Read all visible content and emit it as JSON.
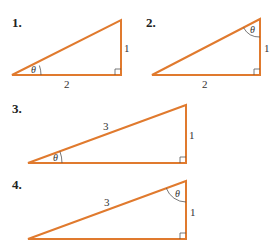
{
  "colors": {
    "triangle_stroke": "#e07a2e",
    "text": "#222222",
    "marks": "#555555"
  },
  "problems": [
    {
      "number": "1.",
      "angle_label": "θ",
      "angle_at": "left vertex",
      "side_labels": {
        "vertical": "1",
        "horizontal": "2"
      }
    },
    {
      "number": "2.",
      "angle_label": "θ",
      "angle_at": "top vertex",
      "side_labels": {
        "vertical": "1",
        "horizontal": "2"
      }
    },
    {
      "number": "3.",
      "angle_label": "θ",
      "angle_at": "left vertex",
      "side_labels": {
        "hypotenuse": "3",
        "vertical": "1"
      }
    },
    {
      "number": "4.",
      "angle_label": "θ",
      "angle_at": "top vertex",
      "side_labels": {
        "hypotenuse": "3",
        "vertical": "1"
      }
    }
  ]
}
